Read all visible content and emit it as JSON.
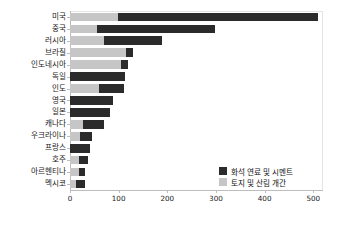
{
  "chart_data": {
    "type": "bar",
    "orientation": "horizontal",
    "stacked": true,
    "title": "",
    "subtitle": "",
    "xlabel": "",
    "ylabel": "",
    "xlim": [
      0,
      520
    ],
    "xticks": [
      0,
      100,
      200,
      300,
      400,
      500
    ],
    "xticklabels": [
      "0",
      "100",
      "200",
      "300",
      "400",
      "500"
    ],
    "grid": false,
    "legend_position": "center-right",
    "categories": [
      "미국",
      "중국",
      "러시아",
      "브라질",
      "인도네시아",
      "독일",
      "인도",
      "영국",
      "일본",
      "캐나다",
      "우크라이나",
      "프랑스",
      "호주",
      "아르헨티나",
      "멕시코"
    ],
    "series": [
      {
        "name": "화석 연료 및 시멘트",
        "color": "#2b2b2b",
        "values": [
          412,
          243,
          119,
          14,
          14,
          113,
          51,
          88,
          82,
          43,
          25,
          41,
          18,
          12,
          19
        ]
      },
      {
        "name": "토지 및 산림 개간",
        "color": "#c6c6c6",
        "values": [
          98,
          55,
          70,
          115,
          105,
          0,
          60,
          0,
          0,
          27,
          21,
          0,
          18,
          19,
          12
        ]
      }
    ],
    "totals": [
      510,
      298,
      189,
      129,
      119,
      113,
      111,
      88,
      82,
      70,
      46,
      41,
      36,
      31,
      31
    ]
  },
  "legend": {
    "items": [
      {
        "label": "화석 연료 및 시멘트",
        "color": "#2b2b2b"
      },
      {
        "label": "토지 및 산림 개간",
        "color": "#c6c6c6"
      }
    ]
  }
}
